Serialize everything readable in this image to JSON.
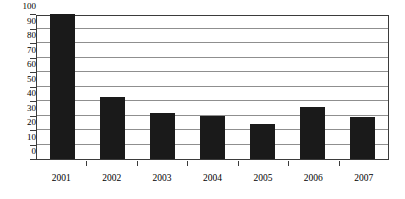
{
  "chart_data": {
    "type": "bar",
    "title": "",
    "xlabel": "",
    "ylabel": "",
    "categories": [
      "2001",
      "2002",
      "2003",
      "2004",
      "2005",
      "2006",
      "2007"
    ],
    "values": [
      100,
      43,
      32,
      30,
      24,
      36,
      29
    ],
    "ylim": [
      0,
      100
    ],
    "ytick_labels": [
      "100",
      "90",
      "80",
      "70",
      "60",
      "50",
      "40",
      "30",
      "20",
      "10",
      "0"
    ],
    "ytick_values": [
      100,
      90,
      80,
      70,
      60,
      50,
      40,
      30,
      20,
      10,
      0
    ],
    "ytick_step": 10,
    "grid": true,
    "grid_axis": "y",
    "legend": false,
    "bar_color": "#1a1a1a",
    "grid_color": "#8f8f8f",
    "frame_color": "#3b3b3b",
    "background_color": "#ffffff"
  }
}
